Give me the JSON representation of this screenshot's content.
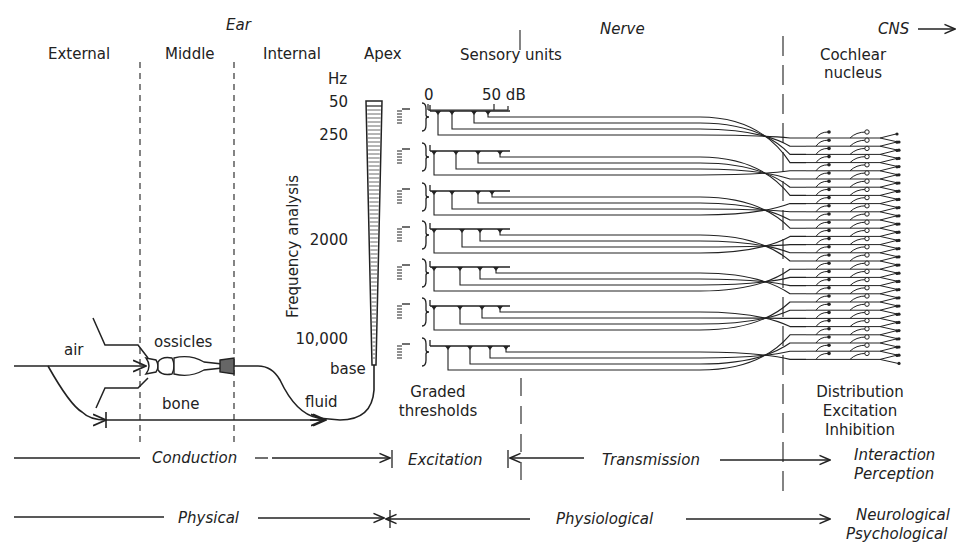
{
  "header": {
    "ear": "Ear",
    "nerve": "Nerve",
    "cns": "CNS",
    "cns_arrow": "→"
  },
  "regions": {
    "external": "External",
    "middle": "Middle",
    "internal": "Internal",
    "apex": "Apex",
    "sensory_units": "Sensory units",
    "cochlear_nucleus_1": "Cochlear",
    "cochlear_nucleus_2": "nucleus"
  },
  "cochlea": {
    "unit": "Hz",
    "ticks": [
      "50",
      "250",
      "2000",
      "10,000"
    ],
    "axis_label": "Frequency analysis",
    "base": "base"
  },
  "threshold_scale": {
    "zero": "0",
    "max": "50 dB"
  },
  "conduction_paths": {
    "air": "air",
    "ossicles": "ossicles",
    "bone": "bone",
    "fluid": "fluid"
  },
  "annotations": {
    "graded_1": "Graded",
    "graded_2": "thresholds",
    "cn_functions": [
      "Distribution",
      "Excitation",
      "Inhibition"
    ]
  },
  "process_row": {
    "conduction": "Conduction",
    "excitation": "Excitation",
    "transmission": "Transmission",
    "interaction": "Interaction",
    "perception": "Perception"
  },
  "domain_row": {
    "physical": "Physical",
    "physiological": "Physiological",
    "neurological": "Neurological",
    "psychological": "Psychological"
  },
  "sensory_unit_count": 7
}
